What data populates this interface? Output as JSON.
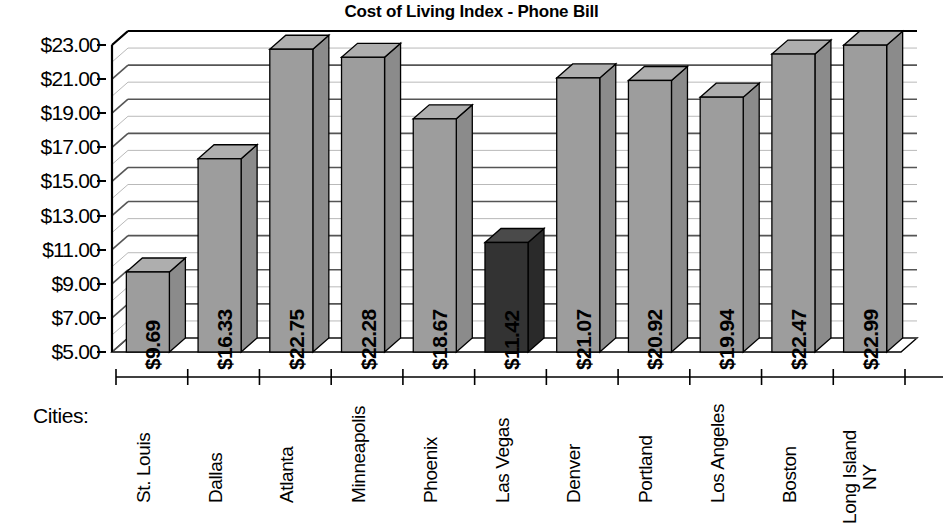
{
  "chart_data": {
    "type": "bar",
    "title": "Cost of Living Index - Phone Bill",
    "xlabel": "Cities:",
    "ylabel": "",
    "ylim": [
      5.0,
      23.0
    ],
    "ytick_step": 2.0,
    "minor_grid_step": 1.0,
    "grid": true,
    "legend": "none",
    "categories": [
      "St. Louis",
      "Dallas",
      "Atlanta",
      "Minneapolis",
      "Phoenix",
      "Las Vegas",
      "Denver",
      "Portland",
      "Los Angeles",
      "Boston",
      "Long Island NY"
    ],
    "values": [
      9.69,
      16.33,
      22.75,
      22.28,
      18.67,
      11.42,
      21.07,
      20.92,
      19.94,
      22.47,
      22.99
    ],
    "value_labels": [
      "$9.69",
      "$16.33",
      "$22.75",
      "$22.28",
      "$18.67",
      "$11.42",
      "$21.07",
      "$20.92",
      "$19.94",
      "$22.47",
      "$22.99"
    ],
    "ytick_labels": [
      "$23.00",
      "$21.00",
      "$19.00",
      "$17.00",
      "$15.00",
      "$13.00",
      "$11.00",
      "$9.00",
      "$7.00",
      "$5.00"
    ],
    "ytick_values": [
      23.0,
      21.0,
      19.0,
      17.0,
      15.0,
      13.0,
      11.0,
      9.0,
      7.0,
      5.0
    ],
    "highlight_index": 5,
    "highlight_category": "Las Vegas",
    "colors": {
      "bar_front": "#9d9d9d",
      "bar_top": "#aeaeae",
      "bar_side": "#8b8b8b",
      "bar_highlight_front": "#333333",
      "bar_highlight_top": "#4a4a4a",
      "bar_highlight_side": "#2a2a2a",
      "outline": "#000000",
      "major_grid": "#555555",
      "minor_grid": "#b9b9b9",
      "axis": "#000000",
      "background": "#ffffff"
    }
  },
  "axis_caption": {
    "text": "Cities:"
  }
}
